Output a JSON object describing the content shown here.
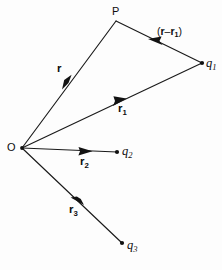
{
  "figure": {
    "kind": "vector-diagram",
    "background_color": "#fdfdfd",
    "ink_color": "#101010",
    "width": 222,
    "height": 270
  },
  "points": {
    "origin": {
      "id": "O",
      "label": "O",
      "x": 22,
      "y": 148,
      "has_dot": true
    },
    "field_point": {
      "id": "P",
      "label": "P",
      "x": 116,
      "y": 21,
      "has_dot": false
    },
    "charge_1": {
      "id": "q1",
      "label_base": "q",
      "label_sub": "1",
      "x": 202,
      "y": 63,
      "has_dot": true
    },
    "charge_2": {
      "id": "q2",
      "label_base": "q",
      "label_sub": "2",
      "x": 117,
      "y": 152,
      "has_dot": true
    },
    "charge_3": {
      "id": "q3",
      "label_base": "q",
      "label_sub": "3",
      "x": 122,
      "y": 243,
      "has_dot": true
    }
  },
  "vectors": [
    {
      "name": "r",
      "label_base": "r",
      "label_sub": "",
      "from": "origin",
      "to": "field_point",
      "x1": 22,
      "y1": 148,
      "x2": 116,
      "y2": 21,
      "arrow_t": 0.49,
      "label_x": 58,
      "label_y": 68
    },
    {
      "name": "r1",
      "label_base": "r",
      "label_sub": "1",
      "from": "origin",
      "to": "charge_1",
      "x1": 22,
      "y1": 148,
      "x2": 202,
      "y2": 63,
      "arrow_t": 0.545,
      "label_x": 119,
      "label_y": 106
    },
    {
      "name": "r2",
      "label_base": "r",
      "label_sub": "2",
      "from": "origin",
      "to": "charge_2",
      "x1": 22,
      "y1": 148,
      "x2": 117,
      "y2": 152,
      "arrow_t": 0.685,
      "label_x": 81,
      "label_y": 157
    },
    {
      "name": "r3",
      "label_base": "r",
      "label_sub": "3",
      "from": "origin",
      "to": "charge_3",
      "x1": 22,
      "y1": 148,
      "x2": 122,
      "y2": 243,
      "arrow_t": 0.565,
      "label_x": 70,
      "label_y": 205
    },
    {
      "name": "r-minus-r1",
      "label_base": "",
      "label_sub": "",
      "from": "charge_1",
      "to": "field_point",
      "x1": 202,
      "y1": 63,
      "x2": 116,
      "y2": 21,
      "arrow_t": 0.545,
      "label_x": 157,
      "label_y": 28
    }
  ],
  "labels": {
    "origin_text": "O",
    "field_point_text": "P",
    "vector_r_text": "r",
    "vector_r1_text": "r",
    "vector_r1_sub": "1",
    "vector_r2_text": "r",
    "vector_r2_sub": "2",
    "vector_r3_text": "r",
    "vector_r3_sub": "3",
    "charge_1_text": "q",
    "charge_1_sub": "1",
    "charge_2_text": "q",
    "charge_2_sub": "2",
    "charge_3_text": "q",
    "charge_3_sub": "3",
    "separation_open_paren": "(",
    "separation_r": "r",
    "separation_minus": "–",
    "separation_r1": "r",
    "separation_r1_sub": "1",
    "separation_close_paren": ")"
  }
}
